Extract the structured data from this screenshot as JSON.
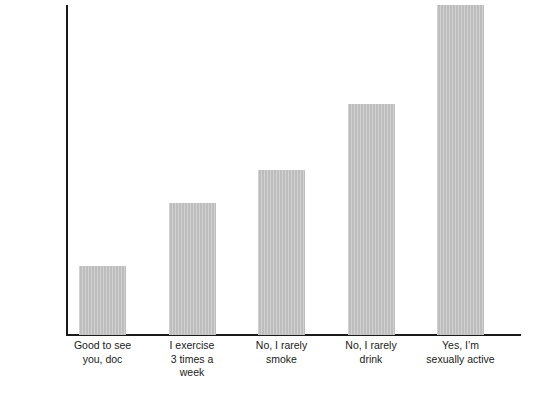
{
  "chart_data": {
    "type": "bar",
    "title": "",
    "subtitle": "",
    "xlabel": "",
    "ylabel": "HOW BIG OF A LIE IT IS",
    "categories": [
      "Good to see\nyou, doc",
      "I exercise\n3 times a\nweek",
      "No, I rarely\nsmoke",
      "No, I rarely\ndrink",
      "Yes, I’m\nsexually active"
    ],
    "values": [
      21,
      40,
      50,
      70,
      100
    ],
    "ylim": [
      0,
      100
    ],
    "grid": false,
    "legend": false,
    "legend_position": "none",
    "axis_ticks": {
      "y_tick_labels": [],
      "x_tick_labels": [
        "Good to see you, doc",
        "I exercise 3 times a week",
        "No, I rarely smoke",
        "No, I rarely drink",
        "Yes, I’m sexually active"
      ]
    },
    "annotations": [],
    "colors": {
      "bar_fill": "#bdbdbd",
      "axis": "#1a1a1a",
      "text": "#1a1a1a",
      "background": "#ffffff"
    }
  }
}
